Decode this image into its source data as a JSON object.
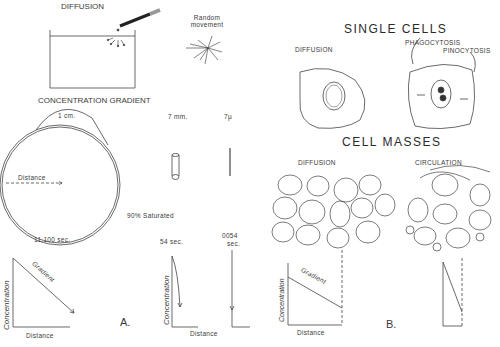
{
  "panel_a": {
    "title": "DIFFUSION",
    "random_movement": "Random movement",
    "concentration_gradient": "CONCENTRATION GRADIENT",
    "circle_width": "1 cm.",
    "distance_arrow": "Distance",
    "cylinder_label": "7 mm.",
    "micro_label": "7µ",
    "saturated": "90% Saturated",
    "time_large": "11,100 sec.",
    "time_mid": "54 sec.",
    "time_small_val": "0054",
    "time_small_unit": "sec.",
    "graph": {
      "y_label": "Concentration",
      "x_label": "Distance",
      "line_label": "Gradient"
    },
    "graph2": {
      "y_label": "Concentration",
      "x_label": "Distance"
    },
    "panel_letter": "A."
  },
  "panel_b": {
    "single_cells": "SINGLE CELLS",
    "diffusion": "DIFFUSION",
    "phagocytosis": "PHAGOCYTOSIS",
    "pinocytosis": "PINOCYTOSIS",
    "cell_masses": "CELL MASSES",
    "mass_diffusion": "DIFFUSION",
    "circulation": "CIRCULATION",
    "graph": {
      "y_label": "Concentration",
      "x_label": "Distance",
      "line_label": "Gradient"
    },
    "panel_letter": "B."
  }
}
